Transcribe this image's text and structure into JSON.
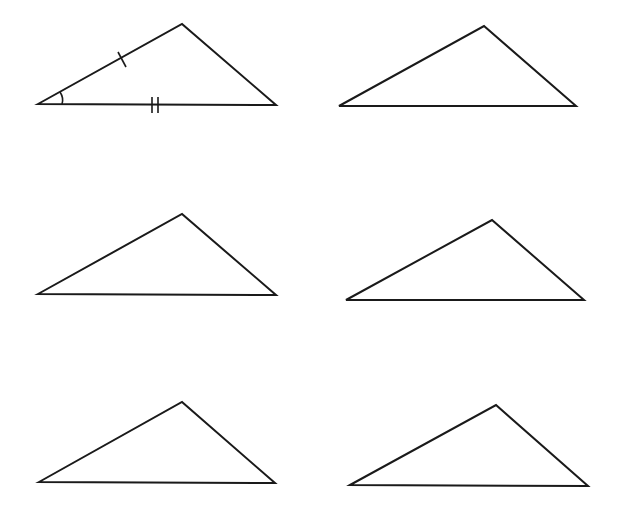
{
  "figure": {
    "stroke_color": "#1a1a1a",
    "background": "#ffffff",
    "triangles": [
      {
        "id": 1,
        "points": [
          [
            38,
            104
          ],
          [
            182,
            24
          ],
          [
            276,
            105
          ]
        ],
        "markings": {
          "single_tick_left_side": [
            [
              118,
              52
            ],
            [
              126,
              67
            ]
          ],
          "double_tick_base": [
            [
              [
                152,
                97
              ],
              [
                152,
                113
              ]
            ],
            [
              [
                158,
                97
              ],
              [
                158,
                113
              ]
            ]
          ],
          "angle_arc_left_vertex": "M 60 92 Q 64 98 62 104"
        }
      },
      {
        "id": 2,
        "points": [
          [
            339,
            106
          ],
          [
            484,
            26
          ],
          [
            576,
            106
          ]
        ]
      },
      {
        "id": 3,
        "points": [
          [
            38,
            294
          ],
          [
            182,
            214
          ],
          [
            276,
            295
          ]
        ]
      },
      {
        "id": 4,
        "points": [
          [
            346,
            300
          ],
          [
            492,
            220
          ],
          [
            584,
            300
          ]
        ]
      },
      {
        "id": 5,
        "points": [
          [
            39,
            482
          ],
          [
            182,
            402
          ],
          [
            275,
            483
          ]
        ]
      },
      {
        "id": 6,
        "points": [
          [
            350,
            485
          ],
          [
            496,
            405
          ],
          [
            588,
            486
          ]
        ]
      }
    ]
  }
}
